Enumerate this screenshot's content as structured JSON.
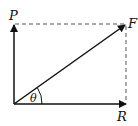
{
  "diagram": {
    "type": "vector-resolution",
    "labels": {
      "p": "P",
      "f": "F",
      "r": "R",
      "theta": "θ"
    },
    "colors": {
      "line": "#111111",
      "dashed": "#555555"
    }
  }
}
